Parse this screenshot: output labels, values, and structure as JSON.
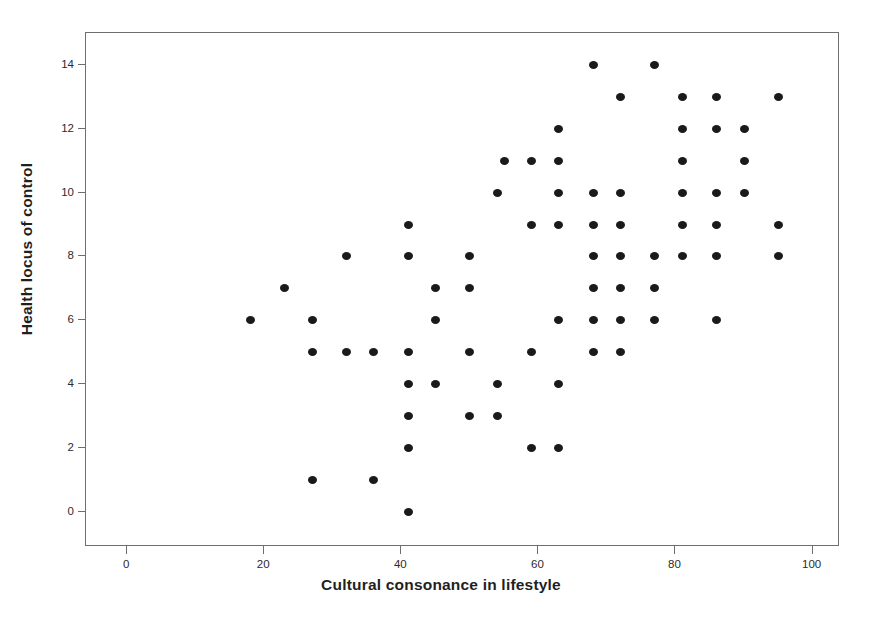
{
  "chart_data": {
    "type": "scatter",
    "title": "",
    "xlabel": "Cultural consonance in lifestyle",
    "ylabel": "Health locus of control",
    "xlim": [
      -6,
      104
    ],
    "ylim": [
      -1.1,
      15.0
    ],
    "grid": false,
    "legend": null,
    "xticks": [
      0,
      20,
      40,
      60,
      80,
      100
    ],
    "yticks": [
      0,
      2,
      4,
      6,
      8,
      10,
      12,
      14
    ],
    "marker": {
      "shape": "circle",
      "color": "#1a1a1a",
      "size_px": 9
    },
    "points": [
      {
        "x": 18,
        "y": 6
      },
      {
        "x": 23,
        "y": 7
      },
      {
        "x": 27,
        "y": 6
      },
      {
        "x": 27,
        "y": 5
      },
      {
        "x": 27,
        "y": 1
      },
      {
        "x": 32,
        "y": 8
      },
      {
        "x": 32,
        "y": 5
      },
      {
        "x": 36,
        "y": 5
      },
      {
        "x": 36,
        "y": 1
      },
      {
        "x": 41,
        "y": 9
      },
      {
        "x": 41,
        "y": 8
      },
      {
        "x": 41,
        "y": 5
      },
      {
        "x": 41,
        "y": 4
      },
      {
        "x": 41,
        "y": 3
      },
      {
        "x": 41,
        "y": 2
      },
      {
        "x": 41,
        "y": 0
      },
      {
        "x": 45,
        "y": 7
      },
      {
        "x": 45,
        "y": 6
      },
      {
        "x": 45,
        "y": 4
      },
      {
        "x": 50,
        "y": 8
      },
      {
        "x": 50,
        "y": 7
      },
      {
        "x": 50,
        "y": 5
      },
      {
        "x": 50,
        "y": 3
      },
      {
        "x": 54,
        "y": 10
      },
      {
        "x": 54,
        "y": 4
      },
      {
        "x": 54,
        "y": 3
      },
      {
        "x": 55,
        "y": 11
      },
      {
        "x": 59,
        "y": 11
      },
      {
        "x": 59,
        "y": 9
      },
      {
        "x": 59,
        "y": 5
      },
      {
        "x": 59,
        "y": 2
      },
      {
        "x": 63,
        "y": 12
      },
      {
        "x": 63,
        "y": 11
      },
      {
        "x": 63,
        "y": 10
      },
      {
        "x": 63,
        "y": 9
      },
      {
        "x": 63,
        "y": 6
      },
      {
        "x": 63,
        "y": 4
      },
      {
        "x": 63,
        "y": 2
      },
      {
        "x": 68,
        "y": 14
      },
      {
        "x": 68,
        "y": 10
      },
      {
        "x": 68,
        "y": 9
      },
      {
        "x": 68,
        "y": 8
      },
      {
        "x": 68,
        "y": 7
      },
      {
        "x": 68,
        "y": 6
      },
      {
        "x": 68,
        "y": 5
      },
      {
        "x": 72,
        "y": 13
      },
      {
        "x": 72,
        "y": 10
      },
      {
        "x": 72,
        "y": 9
      },
      {
        "x": 72,
        "y": 8
      },
      {
        "x": 72,
        "y": 7
      },
      {
        "x": 72,
        "y": 6
      },
      {
        "x": 72,
        "y": 5
      },
      {
        "x": 77,
        "y": 14
      },
      {
        "x": 77,
        "y": 8
      },
      {
        "x": 77,
        "y": 7
      },
      {
        "x": 77,
        "y": 6
      },
      {
        "x": 81,
        "y": 13
      },
      {
        "x": 81,
        "y": 12
      },
      {
        "x": 81,
        "y": 11
      },
      {
        "x": 81,
        "y": 10
      },
      {
        "x": 81,
        "y": 9
      },
      {
        "x": 81,
        "y": 8
      },
      {
        "x": 86,
        "y": 13
      },
      {
        "x": 86,
        "y": 12
      },
      {
        "x": 86,
        "y": 10
      },
      {
        "x": 86,
        "y": 9
      },
      {
        "x": 86,
        "y": 8
      },
      {
        "x": 86,
        "y": 6
      },
      {
        "x": 90,
        "y": 12
      },
      {
        "x": 90,
        "y": 11
      },
      {
        "x": 90,
        "y": 10
      },
      {
        "x": 95,
        "y": 13
      },
      {
        "x": 95,
        "y": 9
      },
      {
        "x": 95,
        "y": 8
      }
    ]
  }
}
